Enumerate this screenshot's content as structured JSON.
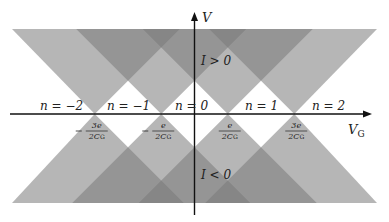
{
  "diagram": {
    "axes": {
      "x_label": "V",
      "x_label_sub": "G",
      "y_label": "V"
    },
    "degeneracy_points": [
      {
        "num": "3e",
        "den": "2C",
        "den_sub": "G",
        "sign": "-",
        "value": -1.5
      },
      {
        "num": "e",
        "den": "2C",
        "den_sub": "G",
        "sign": "-",
        "value": -0.5
      },
      {
        "num": "e",
        "den": "2C",
        "den_sub": "G",
        "sign": "",
        "value": 0.5
      },
      {
        "num": "3e",
        "den": "2C",
        "den_sub": "G",
        "sign": "",
        "value": 1.5
      }
    ],
    "charge_states": [
      "n = −2",
      "n = −1",
      "n = 0",
      "n = 1",
      "n = 2"
    ],
    "region_labels": {
      "upper": "I > 0",
      "lower": "I < 0"
    },
    "colors": {
      "cone_fill": "#7a7a7a",
      "axis": "#111111",
      "background": "#ffffff"
    }
  }
}
